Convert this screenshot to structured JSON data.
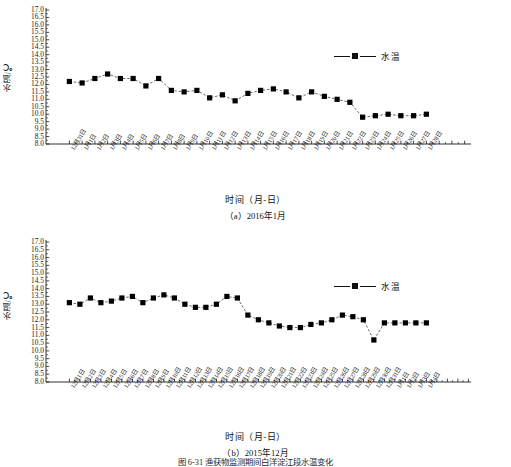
{
  "figure": {
    "caption": "图 6-31  渔获物监测期间白洋淀江段水温变化"
  },
  "panels": [
    {
      "id": "a",
      "subcaption": "（a）2016年1月",
      "xaxis_title": "时间（月-日）",
      "ylabel": "水温/℃",
      "legend_label": "水温"
    },
    {
      "id": "b",
      "subcaption": "（b）2015年12月",
      "xaxis_title": "时间（月-日）",
      "ylabel": "水温/℃",
      "legend_label": "水温"
    }
  ],
  "chart_data": [
    {
      "type": "line",
      "title": "（a）2016年1月",
      "xlabel": "时间（月-日）",
      "ylabel": "水温/℃",
      "ylim": [
        8.0,
        17.0
      ],
      "ytick_step": 0.5,
      "yticks": [
        "8.0",
        "8.5",
        "9.0",
        "9.5",
        "10.0",
        "10.5",
        "11.0",
        "11.5",
        "12.0",
        "12.5",
        "13.0",
        "13.5",
        "14.0",
        "14.5",
        "15.0",
        "15.5",
        "16.0",
        "16.5",
        "17.0"
      ],
      "grid": false,
      "legend": [
        "水温"
      ],
      "legend_position": "upper-right",
      "marker": "square",
      "categories": [
        "12月31日",
        "1月1日",
        "1月2日",
        "1月3日",
        "1月4日",
        "1月5日",
        "1月6日",
        "1月7日",
        "1月8日",
        "1月9日",
        "1月10日",
        "1月11日",
        "1月12日",
        "1月13日",
        "1月14日",
        "1月15日",
        "1月16日",
        "1月17日",
        "1月18日",
        "1月19日",
        "1月20日",
        "1月21日",
        "1月22日",
        "1月23日",
        "1月24日",
        "1月25日",
        "1月26日",
        "1月27日",
        "1月28日"
      ],
      "series": [
        {
          "name": "水温",
          "values": [
            12.2,
            12.1,
            12.4,
            12.7,
            12.4,
            12.4,
            11.9,
            12.4,
            11.6,
            11.5,
            11.6,
            11.1,
            11.3,
            10.9,
            11.4,
            11.6,
            11.7,
            11.5,
            11.1,
            11.5,
            11.2,
            11.0,
            10.8,
            9.8,
            9.9,
            10.0,
            9.9,
            9.9,
            10.0
          ]
        }
      ]
    },
    {
      "type": "line",
      "title": "（b）2015年12月",
      "xlabel": "时间（月-日）",
      "ylabel": "水温/℃",
      "ylim": [
        8.0,
        17.0
      ],
      "ytick_step": 0.5,
      "yticks": [
        "8.0",
        "8.5",
        "9.0",
        "9.5",
        "10.0",
        "10.5",
        "11.0",
        "11.5",
        "12.0",
        "12.5",
        "13.0",
        "13.5",
        "14.0",
        "14.5",
        "15.0",
        "15.5",
        "16.0",
        "16.5",
        "17.0"
      ],
      "grid": false,
      "legend": [
        "水温"
      ],
      "legend_position": "upper-right",
      "marker": "square",
      "categories": [
        "12月1日",
        "12月2日",
        "12月3日",
        "12月4日",
        "12月5日",
        "12月6日",
        "12月7日",
        "12月8日",
        "12月9日",
        "12月10日",
        "12月11日",
        "12月12日",
        "12月13日",
        "12月14日",
        "12月15日",
        "12月16日",
        "12月17日",
        "12月18日",
        "12月19日",
        "12月20日",
        "12月21日",
        "12月22日",
        "12月23日",
        "12月24日",
        "12月25日",
        "12月26日",
        "12月27日",
        "12月28日",
        "12月29日",
        "12月30日",
        "12月31日",
        "1月1日",
        "1月2日",
        "1月3日",
        "1月4日"
      ],
      "series": [
        {
          "name": "水温",
          "values": [
            13.1,
            13.0,
            13.4,
            13.1,
            13.2,
            13.4,
            13.5,
            13.1,
            13.4,
            13.6,
            13.4,
            13.0,
            12.8,
            12.8,
            13.0,
            13.5,
            13.4,
            12.3,
            12.0,
            11.8,
            11.6,
            11.5,
            11.5,
            11.7,
            11.8,
            12.0,
            12.3,
            12.2,
            12.0,
            10.7,
            11.8,
            11.8,
            11.8,
            11.8,
            11.8
          ]
        }
      ]
    }
  ]
}
